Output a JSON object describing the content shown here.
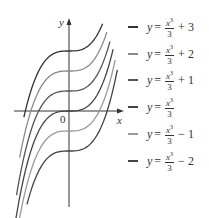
{
  "chart_data": {
    "type": "line",
    "title": "",
    "xlabel": "x",
    "ylabel": "y",
    "origin_label": "0",
    "function_family": "y = x^3/3 + C",
    "xlim": [
      -2.7,
      2.6
    ],
    "ylim": [
      -4.8,
      4.6
    ],
    "grid": false,
    "legend_position": "right",
    "series": [
      {
        "name": "y = x³/3 + 3",
        "C": 3,
        "x_range": [
          -2.15,
          1.6
        ],
        "color": "#333333"
      },
      {
        "name": "y = x³/3 + 2",
        "C": 2,
        "x_range": [
          -2.35,
          1.8
        ],
        "color": "#8a8a8a"
      },
      {
        "name": "y = x³/3 + 1",
        "C": 1,
        "x_range": [
          -2.5,
          1.95
        ],
        "color": "#555555"
      },
      {
        "name": "y = x³/3",
        "C": 0,
        "x_range": [
          -2.6,
          2.1
        ],
        "color": "#444444"
      },
      {
        "name": "y = x³/3 − 1",
        "C": -1,
        "x_range": [
          -2.55,
          2.2
        ],
        "color": "#9a9a9a"
      },
      {
        "name": "y = x³/3 − 2",
        "C": -2,
        "x_range": [
          -2.0,
          2.3
        ],
        "color": "#444444"
      }
    ]
  },
  "legend": {
    "items": [
      {
        "lhs": "y",
        "eq": "=",
        "num": "x",
        "exp": "3",
        "den": "3",
        "const": "+ 3",
        "color": "#333333"
      },
      {
        "lhs": "y",
        "eq": "=",
        "num": "x",
        "exp": "3",
        "den": "3",
        "const": "+ 2",
        "color": "#8a8a8a"
      },
      {
        "lhs": "y",
        "eq": "=",
        "num": "x",
        "exp": "3",
        "den": "3",
        "const": "+ 1",
        "color": "#555555"
      },
      {
        "lhs": "y",
        "eq": "=",
        "num": "x",
        "exp": "3",
        "den": "3",
        "const": "",
        "color": "#444444"
      },
      {
        "lhs": "y",
        "eq": "=",
        "num": "x",
        "exp": "3",
        "den": "3",
        "const": "− 1",
        "color": "#9a9a9a"
      },
      {
        "lhs": "y",
        "eq": "=",
        "num": "x",
        "exp": "3",
        "den": "3",
        "const": "− 2",
        "color": "#444444"
      }
    ]
  }
}
